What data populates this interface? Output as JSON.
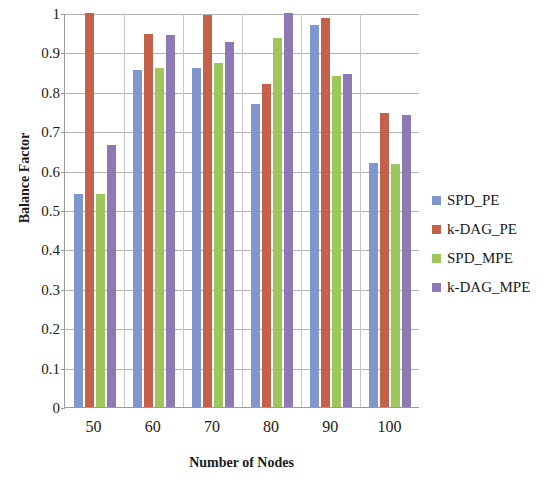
{
  "chart_data": {
    "type": "bar",
    "title": "",
    "xlabel": "Number of Nodes",
    "ylabel": "Balance Factor",
    "categories": [
      "50",
      "60",
      "70",
      "80",
      "90",
      "100"
    ],
    "ylim": [
      0,
      1
    ],
    "ytick_labels": [
      "0",
      "0.1",
      "0.2",
      "0.3",
      "0.4",
      "0.5",
      "0.6",
      "0.7",
      "0.8",
      "0.9",
      "1"
    ],
    "ytick_values": [
      0,
      0.1,
      0.2,
      0.3,
      0.4,
      0.5,
      0.6,
      0.7,
      0.8,
      0.9,
      1
    ],
    "grid": true,
    "legend_position": "right",
    "series": [
      {
        "name": "SPD_PE",
        "color": "#8097cd",
        "values": [
          0.54,
          0.855,
          0.86,
          0.77,
          0.97,
          0.62
        ]
      },
      {
        "name": "k-DAG_PE",
        "color": "#c5604a",
        "values": [
          1.0,
          0.947,
          0.995,
          0.82,
          0.987,
          0.747
        ]
      },
      {
        "name": "SPD_MPE",
        "color": "#9fc65a",
        "values": [
          0.54,
          0.86,
          0.872,
          0.937,
          0.84,
          0.617
        ]
      },
      {
        "name": "k-DAG_MPE",
        "color": "#8d7ab5",
        "values": [
          0.665,
          0.943,
          0.927,
          1.0,
          0.845,
          0.742
        ]
      }
    ]
  }
}
